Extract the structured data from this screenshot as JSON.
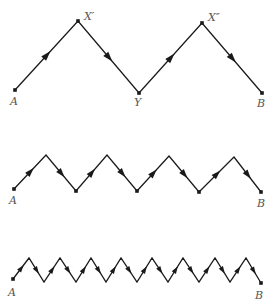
{
  "figure": {
    "line_color": "#1a1a1a",
    "label_color": "#555555",
    "panels": [
      {
        "id": "top",
        "points": [
          [
            15,
            90
          ],
          [
            78,
            21
          ],
          [
            139,
            93
          ],
          [
            202,
            23
          ],
          [
            262,
            93
          ]
        ],
        "dots": [
          0,
          1,
          2,
          3,
          4
        ],
        "labels": [
          {
            "text": "A",
            "x": 10,
            "y": 105
          },
          {
            "text": "X′",
            "x": 84,
            "y": 20
          },
          {
            "text": "Y",
            "x": 134,
            "y": 106
          },
          {
            "text": "X″",
            "x": 208,
            "y": 21
          },
          {
            "text": "B",
            "x": 257,
            "y": 107
          }
        ]
      },
      {
        "id": "middle",
        "points": [
          [
            14,
            189
          ],
          [
            46,
            155
          ],
          [
            76,
            191
          ],
          [
            107,
            155
          ],
          [
            137,
            191
          ],
          [
            169,
            156
          ],
          [
            199,
            192
          ],
          [
            234,
            157
          ],
          [
            261,
            192
          ]
        ],
        "dots": [
          0,
          2,
          4,
          6,
          8
        ],
        "labels": [
          {
            "text": "A",
            "x": 9,
            "y": 204
          },
          {
            "text": "B",
            "x": 257,
            "y": 207
          }
        ]
      },
      {
        "id": "bottom",
        "points": [
          [
            13,
            279
          ],
          [
            29,
            258
          ],
          [
            44,
            282
          ],
          [
            60,
            258
          ],
          [
            76,
            282
          ],
          [
            91,
            258
          ],
          [
            106,
            282
          ],
          [
            121,
            258
          ],
          [
            137,
            282
          ],
          [
            152,
            258
          ],
          [
            168,
            282
          ],
          [
            183,
            258
          ],
          [
            199,
            282
          ],
          [
            215,
            258
          ],
          [
            230,
            282
          ],
          [
            246,
            258
          ],
          [
            261,
            283
          ]
        ],
        "dots": [
          0,
          16
        ],
        "labels": [
          {
            "text": "A",
            "x": 8,
            "y": 296
          },
          {
            "text": "B",
            "x": 255,
            "y": 299
          }
        ]
      }
    ]
  }
}
